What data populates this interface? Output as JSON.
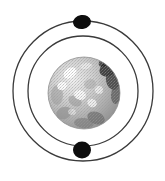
{
  "figure": {
    "title": "Bohr model atom diagram",
    "width": 165,
    "height": 181,
    "background_color": "#ffffff"
  },
  "nucleus": {
    "label": "nucleus",
    "center_x": 84,
    "center_y": 93,
    "radius": 36,
    "fill_color": "#b9b9b9",
    "highlight_color": "#f2f2f2",
    "shadow_color": "#4a4a4a",
    "edge_color": "#8a8a8a"
  },
  "orbits": [
    {
      "name": "outer-orbit",
      "label": "outer orbit",
      "center_x": 83,
      "center_y": 91,
      "radius": 70,
      "stroke_color": "#3a3a3a",
      "stroke_width": 1.3
    },
    {
      "name": "inner-orbit",
      "label": "inner orbit",
      "center_x": 83,
      "center_y": 91,
      "radius": 55,
      "stroke_color": "#3a3a3a",
      "stroke_width": 1.3
    }
  ],
  "electrons": [
    {
      "name": "electron-top",
      "label": "electron",
      "orbit": "outer-orbit",
      "center_x": 82,
      "center_y": 22,
      "radius_x": 9,
      "radius_y": 7,
      "rotation": -8,
      "fill_color": "#0d0d0d"
    },
    {
      "name": "electron-bottom",
      "label": "electron",
      "orbit": "inner-orbit",
      "center_x": 82,
      "center_y": 150,
      "radius_x": 9,
      "radius_y": 8.5,
      "rotation": 0,
      "fill_color": "#0d0d0d"
    }
  ],
  "texture": {
    "speckle_color": "#9a9a9a",
    "patches": [
      {
        "cx": 108,
        "cy": 69,
        "rx": 9,
        "ry": 7,
        "rot": -30,
        "fill": "#2e2e2e",
        "opacity": 0.85
      },
      {
        "cx": 113,
        "cy": 80,
        "rx": 7,
        "ry": 10,
        "rot": -10,
        "fill": "#3a3a3a",
        "opacity": 0.8
      },
      {
        "cx": 104,
        "cy": 62,
        "rx": 6,
        "ry": 4,
        "rot": -40,
        "fill": "#1f1f1f",
        "opacity": 0.7
      },
      {
        "cx": 116,
        "cy": 95,
        "rx": 5,
        "ry": 9,
        "rot": 5,
        "fill": "#555555",
        "opacity": 0.7
      },
      {
        "cx": 96,
        "cy": 118,
        "rx": 9,
        "ry": 6,
        "rot": 20,
        "fill": "#6a6a6a",
        "opacity": 0.7
      },
      {
        "cx": 84,
        "cy": 123,
        "rx": 10,
        "ry": 5,
        "rot": 5,
        "fill": "#7a7a7a",
        "opacity": 0.65
      },
      {
        "cx": 64,
        "cy": 113,
        "rx": 8,
        "ry": 6,
        "rot": -20,
        "fill": "#8a8a8a",
        "opacity": 0.6
      },
      {
        "cx": 57,
        "cy": 95,
        "rx": 6,
        "ry": 10,
        "rot": 0,
        "fill": "#9a9a9a",
        "opacity": 0.55
      },
      {
        "cx": 75,
        "cy": 101,
        "rx": 7,
        "ry": 5,
        "rot": 30,
        "fill": "#8f8f8f",
        "opacity": 0.5
      },
      {
        "cx": 90,
        "cy": 84,
        "rx": 6,
        "ry": 5,
        "rot": -15,
        "fill": "#a5a5a5",
        "opacity": 0.5
      }
    ],
    "highlights": [
      {
        "cx": 70,
        "cy": 73,
        "rx": 7,
        "ry": 5,
        "rot": -35,
        "fill": "#ffffff",
        "opacity": 0.95
      },
      {
        "cx": 62,
        "cy": 86,
        "rx": 5,
        "ry": 4,
        "rot": -20,
        "fill": "#fdfdfd",
        "opacity": 0.9
      },
      {
        "cx": 80,
        "cy": 95,
        "rx": 6,
        "ry": 5,
        "rot": 15,
        "fill": "#fbfbfb",
        "opacity": 0.85
      },
      {
        "cx": 92,
        "cy": 103,
        "rx": 5,
        "ry": 4,
        "rot": 25,
        "fill": "#f7f7f7",
        "opacity": 0.8
      },
      {
        "cx": 99,
        "cy": 90,
        "rx": 4,
        "ry": 4,
        "rot": 0,
        "fill": "#f4f4f4",
        "opacity": 0.75
      },
      {
        "cx": 86,
        "cy": 66,
        "rx": 6,
        "ry": 3,
        "rot": -10,
        "fill": "#f0f0f0",
        "opacity": 0.7
      },
      {
        "cx": 72,
        "cy": 112,
        "rx": 4,
        "ry": 3,
        "rot": 10,
        "fill": "#eeeeee",
        "opacity": 0.6
      }
    ]
  }
}
